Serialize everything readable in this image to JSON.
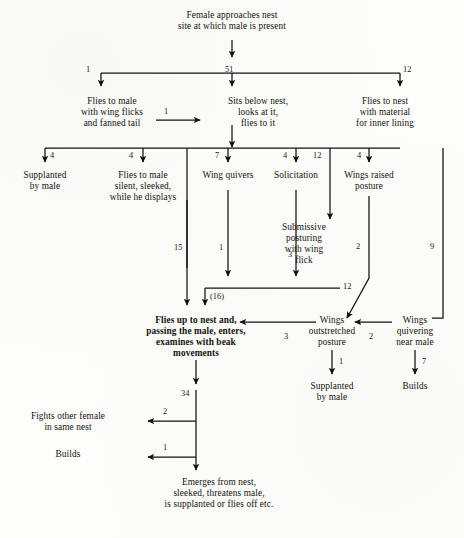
{
  "diagram": {
    "type": "flowchart",
    "background_color": "#fdfdfb",
    "ink_color": "#14110f",
    "nodes": [
      {
        "id": "start",
        "label": "Female approaches nest\nsite at which male is present",
        "x": 232,
        "y": 18,
        "w": 190,
        "bold": false
      },
      {
        "id": "flies_male_wf",
        "label": "Flies to male\nwith wing flicks\nand fanned tail",
        "x": 112,
        "y": 104,
        "w": 96,
        "bold": false
      },
      {
        "id": "sits_below",
        "label": "Sits below nest,\nlooks at it,\nflies to it",
        "x": 258,
        "y": 104,
        "w": 90,
        "bold": false
      },
      {
        "id": "flies_nest",
        "label": "Flies to nest\nwith material\nfor inner lining",
        "x": 385,
        "y": 104,
        "w": 92,
        "bold": false
      },
      {
        "id": "supplanted_1",
        "label": "Supplanted\nby male",
        "x": 45,
        "y": 178,
        "w": 80,
        "bold": false
      },
      {
        "id": "flies_silent",
        "label": "Flies to male\nsilent, sleeked,\nwhile he displays",
        "x": 143,
        "y": 178,
        "w": 100,
        "bold": false
      },
      {
        "id": "wing_quivers",
        "label": "Wing quivers",
        "x": 228,
        "y": 178,
        "w": 72,
        "bold": false
      },
      {
        "id": "solicitation",
        "label": "Solicitation",
        "x": 296,
        "y": 178,
        "w": 66,
        "bold": false
      },
      {
        "id": "wings_raised",
        "label": "Wings raised\nposture",
        "x": 365,
        "y": 178,
        "w": 76,
        "bold": false
      },
      {
        "id": "submissive",
        "label": "Submissive\nposturing\nwith wing\nflick",
        "x": 304,
        "y": 228,
        "w": 64,
        "bold": false
      },
      {
        "id": "flies_up",
        "label": "Flies up to nest and,\npassing the male, enters,\nexamines with beak\nmovements",
        "x": 196,
        "y": 323,
        "w": 132,
        "bold": true
      },
      {
        "id": "wings_out",
        "label": "Wings\noutstretched\nposture",
        "x": 332,
        "y": 323,
        "w": 68,
        "bold": false
      },
      {
        "id": "wings_quiv",
        "label": "Wings\nquivering\nnear male",
        "x": 415,
        "y": 323,
        "w": 62,
        "bold": false
      },
      {
        "id": "supplanted_2",
        "label": "Supplanted\nby male",
        "x": 332,
        "y": 388,
        "w": 72,
        "bold": false
      },
      {
        "id": "builds_r",
        "label": "Builds",
        "x": 415,
        "y": 388,
        "w": 48,
        "bold": false
      },
      {
        "id": "fights",
        "label": "Fights other female\nin same nest",
        "x": 68,
        "y": 418,
        "w": 110,
        "bold": false
      },
      {
        "id": "builds_l",
        "label": "Builds",
        "x": 68,
        "y": 455,
        "w": 48,
        "bold": false
      },
      {
        "id": "emerges",
        "label": "Emerges from nest,\nsleeked, threatens male,\nis supplanted or flies off etc.",
        "x": 219,
        "y": 485,
        "w": 160,
        "bold": false
      }
    ],
    "transition_counts": [
      {
        "id": "n51",
        "value": "51",
        "x": 231,
        "y": 72
      },
      {
        "id": "n1a",
        "value": "1",
        "x": 88,
        "y": 72
      },
      {
        "id": "n12a",
        "value": "12",
        "x": 401,
        "y": 72
      },
      {
        "id": "n1b",
        "value": "1",
        "x": 166,
        "y": 113
      },
      {
        "id": "n4a",
        "value": "4",
        "x": 52,
        "y": 150
      },
      {
        "id": "n4b",
        "value": "4",
        "x": 131,
        "y": 150
      },
      {
        "id": "n7",
        "value": "7",
        "x": 228,
        "y": 150
      },
      {
        "id": "n4c",
        "value": "4",
        "x": 291,
        "y": 150
      },
      {
        "id": "n12b",
        "value": "12",
        "x": 322,
        "y": 150
      },
      {
        "id": "n4d",
        "value": "4",
        "x": 361,
        "y": 150
      },
      {
        "id": "n2r",
        "value": "2",
        "x": 364,
        "y": 248
      },
      {
        "id": "n9",
        "value": "9",
        "x": 437,
        "y": 248
      },
      {
        "id": "n15",
        "value": "15",
        "x": 181,
        "y": 249
      },
      {
        "id": "n1c",
        "value": "1",
        "x": 222,
        "y": 249
      },
      {
        "id": "n3a",
        "value": "3",
        "x": 293,
        "y": 256
      },
      {
        "id": "n12c",
        "value": "12",
        "x": 330,
        "y": 291
      },
      {
        "id": "n16",
        "value": "(16)",
        "x": 215,
        "y": 298
      },
      {
        "id": "n3b",
        "value": "3",
        "x": 289,
        "y": 338
      },
      {
        "id": "n2b",
        "value": "2",
        "x": 374,
        "y": 338
      },
      {
        "id": "n1d",
        "value": "1",
        "x": 342,
        "y": 368
      },
      {
        "id": "n7b",
        "value": "7",
        "x": 424,
        "y": 368
      },
      {
        "id": "n34",
        "value": "34",
        "x": 186,
        "y": 397
      },
      {
        "id": "n2c",
        "value": "2",
        "x": 134,
        "y": 413
      },
      {
        "id": "n1e",
        "value": "1",
        "x": 134,
        "y": 449
      }
    ]
  }
}
